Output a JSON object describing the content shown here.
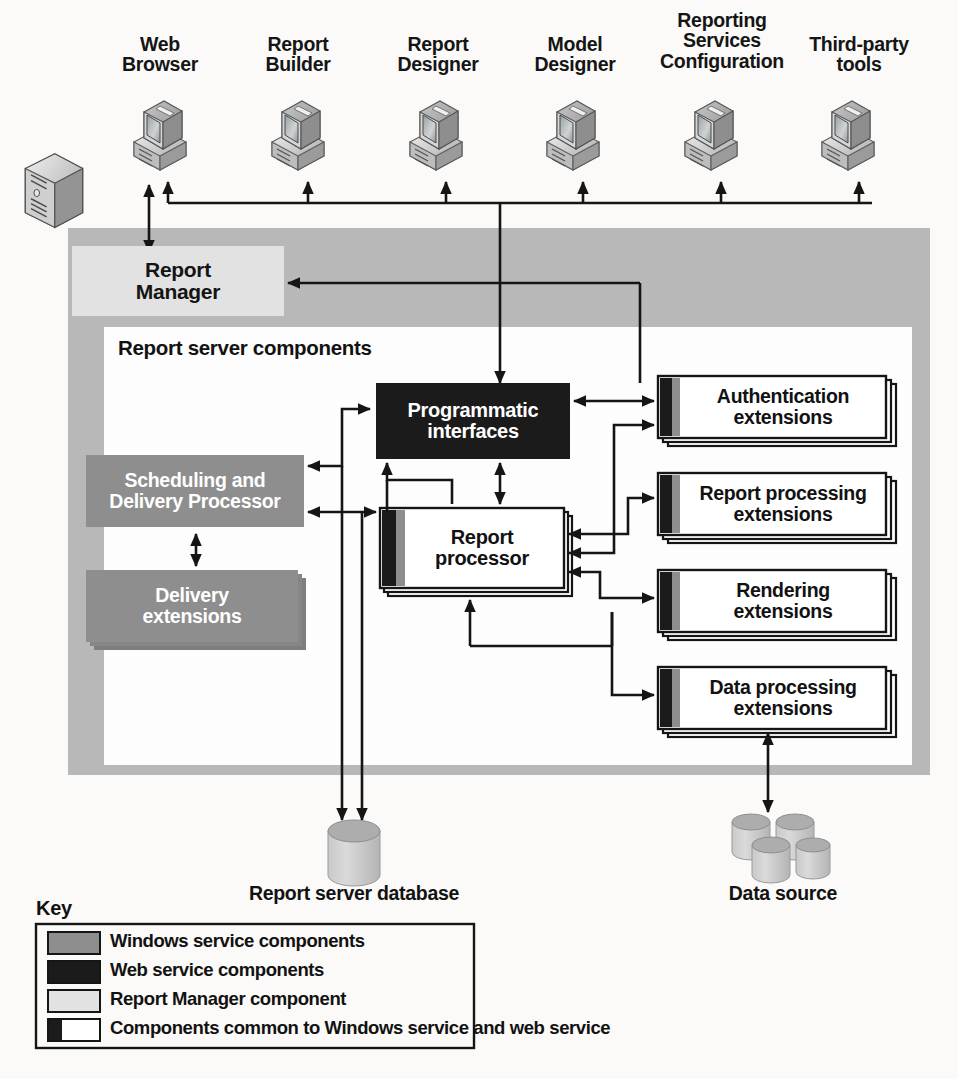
{
  "diagram": {
    "clients": [
      {
        "id": "web-browser",
        "label_line1": "Web",
        "label_line2": "Browser",
        "icon": "desktop-computer-icon"
      },
      {
        "id": "report-builder",
        "label_line1": "Report",
        "label_line2": "Builder",
        "icon": "desktop-computer-icon"
      },
      {
        "id": "report-designer",
        "label_line1": "Report",
        "label_line2": "Designer",
        "icon": "desktop-computer-icon"
      },
      {
        "id": "model-designer",
        "label_line1": "Model",
        "label_line2": "Designer",
        "icon": "desktop-computer-icon"
      },
      {
        "id": "reporting-services-configuration",
        "label_line1": "Reporting",
        "label_line2": "Services",
        "label_line3": "Configuration",
        "icon": "desktop-computer-icon"
      },
      {
        "id": "third-party-tools",
        "label_line1": "Third-party",
        "label_line2": "tools",
        "icon": "desktop-computer-icon"
      }
    ],
    "server_tower": {
      "icon": "server-tower-icon",
      "label": ""
    },
    "report_manager": {
      "label_line1": "Report",
      "label_line2": "Manager",
      "fill": "#e2e2e2",
      "text_color": "#141414"
    },
    "report_server_components": {
      "label": "Report server components",
      "fill": "#ffffff",
      "text_color": "#121212"
    },
    "outer_container": {
      "fill": "#b8b8b8"
    },
    "components": [
      {
        "id": "programmatic-interfaces",
        "line1": "Programmatic",
        "line2": "interfaces",
        "fill": "#1b1b1b",
        "text_color": "#ffffff",
        "kind": "web-service"
      },
      {
        "id": "scheduling-and-delivery-processor",
        "line1": "Scheduling and",
        "line2": "Delivery Processor",
        "fill": "#8e8e8e",
        "text_color": "#ffffff",
        "kind": "windows-service"
      },
      {
        "id": "delivery-extensions",
        "line1": "Delivery",
        "line2": "extensions",
        "fill": "#8e8e8e",
        "text_color": "#ffffff",
        "kind": "windows-service-stack"
      },
      {
        "id": "report-processor",
        "line1": "Report",
        "line2": "processor",
        "fill": "#ffffff",
        "text_color": "#121212",
        "kind": "common-stack"
      },
      {
        "id": "authentication-extensions",
        "line1": "Authentication",
        "line2": "extensions",
        "fill": "#ffffff",
        "text_color": "#121212",
        "kind": "common-stack"
      },
      {
        "id": "report-processing-extensions",
        "line1": "Report processing",
        "line2": "extensions",
        "fill": "#ffffff",
        "text_color": "#121212",
        "kind": "common-stack"
      },
      {
        "id": "rendering-extensions",
        "line1": "Rendering",
        "line2": "extensions",
        "fill": "#ffffff",
        "text_color": "#121212",
        "kind": "common-stack"
      },
      {
        "id": "data-processing-extensions",
        "line1": "Data processing",
        "line2": "extensions",
        "fill": "#ffffff",
        "text_color": "#121212",
        "kind": "common-stack"
      }
    ],
    "datastores": [
      {
        "id": "report-server-database",
        "label": "Report server database",
        "icon": "database-cylinder-icon"
      },
      {
        "id": "data-source",
        "label": "Data source",
        "icon": "database-cluster-icon"
      }
    ],
    "key": {
      "title": "Key",
      "items": [
        {
          "id": "windows-service-components",
          "label": "Windows service components",
          "swatch": "windows-service",
          "color": "#8e8e8e"
        },
        {
          "id": "web-service-components",
          "label": "Web service components",
          "swatch": "web-service",
          "color": "#1b1b1b"
        },
        {
          "id": "report-manager-component",
          "label": "Report Manager component",
          "swatch": "report-manager",
          "color": "#e2e2e2"
        },
        {
          "id": "common-components",
          "label": "Components common to Windows service and web service",
          "swatch": "common",
          "color": "#ffffff"
        }
      ]
    }
  }
}
